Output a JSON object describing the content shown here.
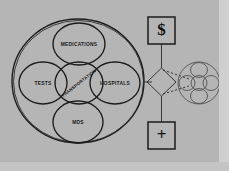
{
  "canvas": {
    "width": 229,
    "height": 171,
    "background_color": "#b9b9b9",
    "stage_color": "#b5b5b5",
    "frame_right_color": "#cfcfcf",
    "frame_bottom_color": "#c4c4c4",
    "ink_color": "#1b1b1b"
  },
  "diagram": {
    "type": "hand-drawn-concept-diagram",
    "main_cluster": {
      "name": "healthcare-system-cluster",
      "outer_circle_label": "",
      "center_node": {
        "label": "TRANSPORTATION"
      },
      "surrounding_nodes": [
        {
          "position": "top",
          "label": "MEDICATIONS"
        },
        {
          "position": "left",
          "label": "TESTS"
        },
        {
          "position": "right",
          "label": "HOSPITALS"
        },
        {
          "position": "bottom",
          "label": "MDS"
        }
      ]
    },
    "right_column": {
      "top_box": {
        "label": "$",
        "icon": "dollar-sign-icon",
        "shape": "square"
      },
      "bottom_box": {
        "label": "+",
        "icon": "plus-sign-icon",
        "shape": "square"
      },
      "decision_node": {
        "label": "",
        "shape": "diamond"
      },
      "mirror_cluster": {
        "name": "mirrored-cluster",
        "node_count": 5,
        "labels": [
          "",
          "",
          "",
          "",
          ""
        ]
      }
    },
    "connectors": [
      {
        "from": "top_box",
        "to": "decision_node",
        "style": "solid"
      },
      {
        "from": "decision_node",
        "to": "bottom_box",
        "style": "solid"
      },
      {
        "from": "main_cluster",
        "to": "decision_node",
        "style": "solid"
      },
      {
        "from": "decision_node",
        "to": "mirror_cluster",
        "style": "dashed"
      }
    ]
  }
}
